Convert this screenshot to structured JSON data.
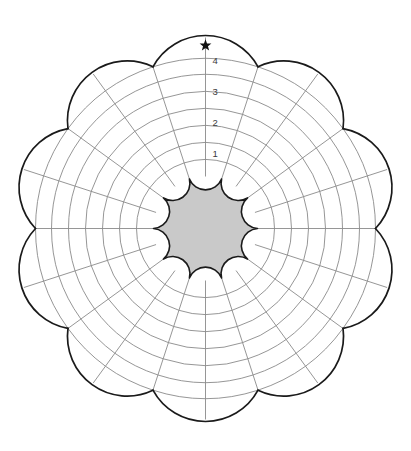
{
  "figure": {
    "title": "",
    "background_color": "#ffffff"
  },
  "chart_data": {
    "type": "polar-rosette-grid",
    "title": "",
    "subtitle": "",
    "xlabel": "",
    "ylabel": "",
    "center": {
      "cx": 205.5,
      "cy": 228.5
    },
    "sectors": {
      "count": 10,
      "angular_width_deg": 36,
      "start_angle_deg": -90,
      "subdivided_by_midspoke": true
    },
    "rings": {
      "count": 7,
      "inner_radius": 52,
      "outer_radius": 170,
      "petal_tip_radius": 193,
      "radii": [
        52,
        69,
        86,
        103,
        120,
        137,
        154,
        170
      ],
      "grid": true
    },
    "tick_labels": [
      "1",
      "2",
      "3",
      "4"
    ],
    "tick_label_radii": [
      76,
      107,
      138,
      169
    ],
    "tick_label_angle_deg": -90,
    "annotations": [
      {
        "name": "star-marker",
        "glyph": "★",
        "sector_index": 0,
        "angle_deg": -90,
        "radius": 183
      }
    ],
    "legend": {
      "entries": [],
      "position": "none"
    },
    "series": [],
    "values": []
  },
  "style": {
    "outline_color": "#1a1a1a",
    "grid_color": "#8a8a8a",
    "hub_fill": "#c9c9c9",
    "hub_stroke": "#1a1a1a",
    "petal_fill": "#ffffff",
    "label_color": "#3a3a3a",
    "star_color": "#111111",
    "background": "#ffffff"
  },
  "labels": {
    "ring_1": "1",
    "ring_2": "2",
    "ring_3": "3",
    "ring_4": "4",
    "star": "★"
  }
}
